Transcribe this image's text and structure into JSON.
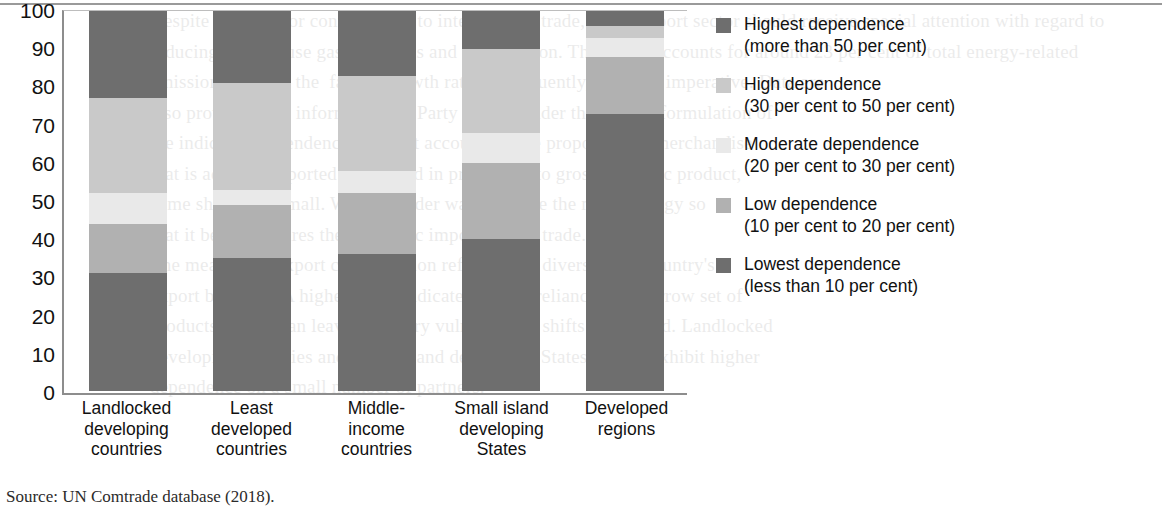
{
  "source_note": "Source: UN Comtrade database (2018).",
  "colors": {
    "highest": "#6e6e6e",
    "high": "#c9c9c9",
    "moderate": "#e9e9e9",
    "low": "#b1b1b1",
    "lowest": "#6e6e6e",
    "axis": "#8d8d8d",
    "text": "#111111"
  },
  "axis": {
    "y_ticks": [
      "100",
      "90",
      "80",
      "70",
      "60",
      "50",
      "40",
      "30",
      "20",
      "10",
      "0"
    ]
  },
  "legend": {
    "items": [
      {
        "name": "highest-dependence",
        "line1": "Highest dependence",
        "line2": "(more than 50 per cent)",
        "color": "#6e6e6e"
      },
      {
        "name": "high-dependence",
        "line1": "High dependence",
        "line2": "(30 per cent to 50 per cent)",
        "color": "#c9c9c9"
      },
      {
        "name": "moderate-dependence",
        "line1": "Moderate dependence",
        "line2": "(20 per cent to 30 per cent)",
        "color": "#e9e9e9"
      },
      {
        "name": "low-dependence",
        "line1": "Low dependence",
        "line2": "(10 per cent to 20 per cent)",
        "color": "#b1b1b1"
      },
      {
        "name": "lowest-dependence",
        "line1": "Lowest dependence",
        "line2": "(less than 10 per cent)",
        "color": "#6e6e6e"
      }
    ]
  },
  "chart_data": {
    "type": "bar",
    "title": "",
    "xlabel": "",
    "ylabel": "",
    "ylim": [
      0,
      100
    ],
    "grid": false,
    "stacked": true,
    "legend_position": "right",
    "categories": [
      "Landlocked developing countries",
      "Least developed countries",
      "Middle-income countries",
      "Small island developing States",
      "Developed regions"
    ],
    "category_label_lines": [
      [
        "Landlocked",
        "developing",
        "countries"
      ],
      [
        "Least",
        "developed",
        "countries"
      ],
      [
        "Middle-",
        "income",
        "countries"
      ],
      [
        "Small island",
        "developing",
        "States"
      ],
      [
        "Developed",
        "regions"
      ]
    ],
    "series": [
      {
        "name": "Lowest dependence (less than 10 per cent)",
        "color": "#6e6e6e",
        "values": [
          31,
          35,
          36,
          40,
          73
        ]
      },
      {
        "name": "Low dependence (10 per cent to 20 per cent)",
        "color": "#b1b1b1",
        "values": [
          13,
          14,
          16,
          20,
          15
        ]
      },
      {
        "name": "Moderate dependence (20 per cent to 30 per cent)",
        "color": "#e9e9e9",
        "values": [
          8,
          4,
          6,
          8,
          5
        ]
      },
      {
        "name": "High dependence (30 per cent to 50 per cent)",
        "color": "#c9c9c9",
        "values": [
          25,
          28,
          25,
          22,
          3
        ]
      },
      {
        "name": "Highest dependence (more than 50 per cent)",
        "color": "#6e6e6e",
        "values": [
          23,
          19,
          17,
          10,
          4
        ]
      }
    ]
  },
  "bleed_text": "Despite these major contributions to international trade, the transport sector should receive special attention with regard to reducing greenhouse gas emissions and air pollution. The sector accounts for around 23 per cent of total energy-related emissions and has the  fastest growth rate; consequently, action is imperative. Data are\nalso provide trend information on Party status. Under the current formulation of\nthe indicator, dependence does not account for the proportion of merchandise\nthat is actually exported. Measured in proportion to gross domestic product,\nsome shares are small. Work is under way to refine the methodology so\nthat it better captures the economic importance of trade.\nThe measure of export concentration reflects how diversified a country's\nexport basket is. A higher index indicates greater reliance on a narrow set of\nproducts, which can leave a country vulnerable to shifts in demand. Landlocked\ndeveloping countries and small island developing States tend to exhibit higher\ndependence on a small number of partners."
}
